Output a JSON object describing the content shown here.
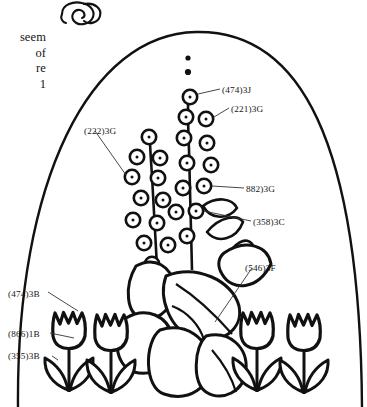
{
  "page": {
    "width": 367,
    "height": 407,
    "background": "#ffffff",
    "ink": "#111111"
  },
  "ornament": {
    "name": "swirl-ornament",
    "description": "decorative curl flourish at top of page"
  },
  "margin_note": {
    "text": "seem\nof\nre\n1",
    "lines": [
      "seem",
      "of",
      "re",
      "1"
    ]
  },
  "illustration": {
    "title": "flower-pattern-illustration",
    "arch_border": "arched frame line",
    "elements": [
      "flower-spike-left",
      "flower-spike-right",
      "large-leaves",
      "tulip-row"
    ],
    "tulip_count": 4
  },
  "callouts": [
    {
      "id": "474-3J",
      "label": "(474)3J",
      "anchor": "bud-upper-right",
      "leader": true
    },
    {
      "id": "221-3G",
      "label": "(221)3G",
      "anchor": "bud-upper-right-2",
      "leader": true
    },
    {
      "id": "222-3G",
      "label": "(222)3G",
      "anchor": "bud-left-spike",
      "leader": true
    },
    {
      "id": "882-3G",
      "label": "882)3G",
      "anchor": "bud-mid-right",
      "leader": true
    },
    {
      "id": "358-3C",
      "label": "(358)3C",
      "anchor": "bud-lower-right",
      "leader": true
    },
    {
      "id": "546-3F",
      "label": "(546)3F",
      "anchor": "large-leaf",
      "leader": true
    },
    {
      "id": "474-3B",
      "label": "(474)3B",
      "anchor": "tulip-petal-cup",
      "leader": true
    },
    {
      "id": "866-1B",
      "label": "(866)1B",
      "anchor": "tulip-stem",
      "leader": true
    },
    {
      "id": "355-3B",
      "label": "(355)3B",
      "anchor": "tulip-leaf",
      "leader": true
    }
  ]
}
